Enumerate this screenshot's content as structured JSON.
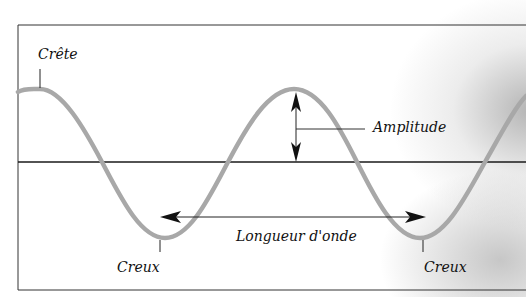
{
  "diagram": {
    "labels": {
      "crest": "Crête",
      "amplitude": "Amplitude",
      "wavelength": "Longueur d'onde",
      "trough_left": "Creux",
      "trough_right": "Creux"
    },
    "colors": {
      "wave": "#a8a8a8",
      "axis": "#1a1a1a",
      "frame": "#333333",
      "text": "#111111"
    }
  }
}
